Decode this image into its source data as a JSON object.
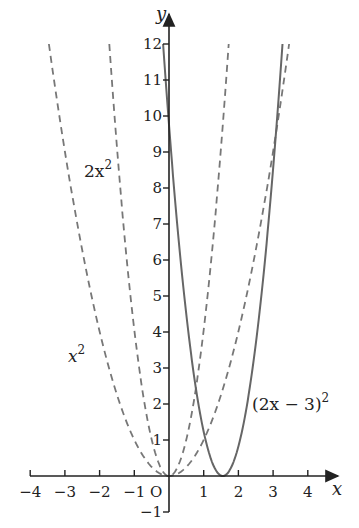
{
  "chart_data": {
    "type": "line",
    "title": "",
    "xlabel": "x",
    "ylabel": "y",
    "origin_label": "O",
    "xlim": [
      -4,
      4
    ],
    "ylim": [
      -1,
      12
    ],
    "grid": false,
    "x_ticks": [
      -4,
      -3,
      -2,
      -1,
      1,
      2,
      3,
      4
    ],
    "x_tick_labels": [
      "−4",
      "−3",
      "−2",
      "−1",
      "1",
      "2",
      "3",
      "4"
    ],
    "y_ticks": [
      -1,
      1,
      2,
      3,
      4,
      5,
      6,
      7,
      8,
      9,
      10,
      11,
      12
    ],
    "y_tick_labels": [
      "−1",
      "1",
      "2",
      "3",
      "4",
      "5",
      "6",
      "7",
      "8",
      "9",
      "10",
      "11",
      "12"
    ],
    "series": [
      {
        "name": "x^2",
        "label": "x²",
        "style": "dashed",
        "expr": "x^2",
        "x_range": [
          -3.46,
          3.46
        ],
        "points": [
          [
            -3.46,
            12
          ],
          [
            -3,
            9
          ],
          [
            -2,
            4
          ],
          [
            -1,
            1
          ],
          [
            0,
            0
          ],
          [
            1,
            1
          ],
          [
            2,
            4
          ],
          [
            3,
            9
          ],
          [
            3.46,
            12
          ]
        ]
      },
      {
        "name": "2x^2",
        "label": "2x²",
        "style": "dashed",
        "expr": "2x^2",
        "x_range": [
          -2.45,
          2.45
        ],
        "points": [
          [
            -2.45,
            12
          ],
          [
            -2,
            8
          ],
          [
            -1,
            2
          ],
          [
            0,
            0
          ],
          [
            1,
            2
          ],
          [
            2,
            8
          ],
          [
            2.45,
            12
          ]
        ]
      },
      {
        "name": "(2x-3)^2",
        "label": "(2x − 3)²",
        "style": "solid",
        "expr": "(2x-3)^2",
        "x_range": [
          -0.23,
          3.23
        ],
        "points": [
          [
            -0.23,
            12
          ],
          [
            0,
            9
          ],
          [
            0.5,
            4
          ],
          [
            1,
            1
          ],
          [
            1.5,
            0
          ],
          [
            2,
            1
          ],
          [
            2.5,
            4
          ],
          [
            3,
            9
          ],
          [
            3.23,
            12
          ]
        ]
      }
    ]
  },
  "labels": {
    "x_axis": "x",
    "y_axis": "y",
    "origin": "O",
    "curve_x2": "x",
    "curve_x2_exp": "2",
    "curve_2x2": "2x",
    "curve_2x2_exp": "2",
    "curve_shift": "(2x − 3)",
    "curve_shift_exp": "2"
  },
  "colors": {
    "axis": "#222222",
    "curve": "#666666"
  }
}
